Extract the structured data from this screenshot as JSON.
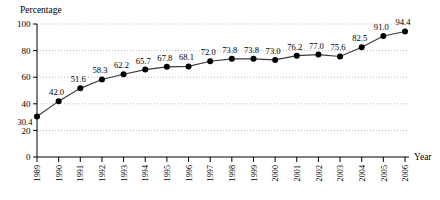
{
  "chart_data": {
    "type": "line",
    "title": "Percentage",
    "xlabel": "Year",
    "ylabel": "Percentage",
    "categories": [
      "1989",
      "1990",
      "1991",
      "1992",
      "1993",
      "1994",
      "1995",
      "1996",
      "1997",
      "1998",
      "1999",
      "2000",
      "2001",
      "2002",
      "2003",
      "2004",
      "2005",
      "2006"
    ],
    "values": [
      30.4,
      42.0,
      51.6,
      58.3,
      62.2,
      65.7,
      67.8,
      68.1,
      72.0,
      73.8,
      73.8,
      73.0,
      76.2,
      77.0,
      75.6,
      82.5,
      91.0,
      94.4
    ],
    "data_labels": [
      "30.4",
      "42.0",
      "51.6",
      "58.3",
      "62.2",
      "65.7",
      "67.8",
      "68.1",
      "72.0",
      "73.8",
      "73.8",
      "73.0",
      "76.2",
      "77.0",
      "75.6",
      "82.5",
      "91.0",
      "94.4"
    ],
    "ylim": [
      0,
      100
    ],
    "yticks": [
      0,
      20,
      40,
      60,
      80,
      100
    ],
    "ytick_labels": [
      "0",
      "20",
      "40",
      "60",
      "80",
      "100"
    ],
    "grid": true,
    "grid_style": "dotted-horizontal",
    "legend": "none",
    "marker": "filled-circle",
    "line_color": "#3a3a3a",
    "marker_color": "#000000",
    "grid_color": "#8a8a8a",
    "background": "#ffffff"
  },
  "axes": {
    "y_axis_caption": "Percentage",
    "x_axis_caption": "Year"
  }
}
